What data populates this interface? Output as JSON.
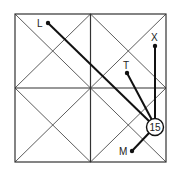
{
  "diagram": {
    "square": {
      "x": 15,
      "y": 14,
      "size": 151,
      "stroke": "#333"
    },
    "center": {
      "x": 90,
      "y": 88
    },
    "hub": {
      "label": "15",
      "x": 155,
      "y": 127,
      "r": 8
    },
    "points": [
      {
        "label": "L",
        "x": 48,
        "y": 23,
        "lx": 38,
        "ly": 26
      },
      {
        "label": "X",
        "x": 155,
        "y": 46,
        "lx": 151,
        "ly": 41
      },
      {
        "label": "T",
        "x": 127,
        "y": 73,
        "lx": 123,
        "ly": 68
      },
      {
        "label": "M",
        "x": 132,
        "y": 151,
        "lx": 118,
        "ly": 155
      }
    ]
  }
}
